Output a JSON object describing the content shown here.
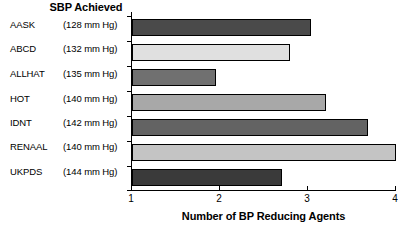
{
  "chart_data": {
    "type": "bar",
    "orientation": "horizontal",
    "title": "SBP Achieved",
    "xlabel": "Number of BP Reducing Agents",
    "ylabel": "",
    "xlim": [
      1,
      4
    ],
    "xticks": [
      "1",
      "2",
      "3",
      "4"
    ],
    "grid": false,
    "legend": null,
    "categories": [
      "AASK",
      "ABCD",
      "ALLHAT",
      "HOT",
      "IDNT",
      "RENAAL",
      "UKPDS"
    ],
    "values": [
      3.03,
      2.8,
      1.95,
      3.2,
      3.68,
      4.0,
      2.7
    ],
    "secondary_labels": [
      "(128 mm Hg)",
      "(132 mm Hg)",
      "(135 mm Hg)",
      "(140 mm Hg)",
      "(142 mm Hg)",
      "(140 mm Hg)",
      "(144 mm Hg)"
    ],
    "bar_colors": [
      "#4a4a4a",
      "#e0e0e0",
      "#707070",
      "#a8a8a8",
      "#636363",
      "#c4c4c4",
      "#3a3a3a"
    ],
    "rows": [
      {
        "study": "AASK",
        "sbp": "(128 mm Hg)",
        "value": 3.03,
        "color": "#4a4a4a"
      },
      {
        "study": "ABCD",
        "sbp": "(132 mm Hg)",
        "value": 2.8,
        "color": "#e0e0e0"
      },
      {
        "study": "ALLHAT",
        "sbp": "(135 mm Hg)",
        "value": 1.95,
        "color": "#707070"
      },
      {
        "study": "HOT",
        "sbp": "(140 mm Hg)",
        "value": 3.2,
        "color": "#a8a8a8"
      },
      {
        "study": "IDNT",
        "sbp": "(142 mm Hg)",
        "value": 3.68,
        "color": "#636363"
      },
      {
        "study": "RENAAL",
        "sbp": "(140 mm Hg)",
        "value": 4.0,
        "color": "#c4c4c4"
      },
      {
        "study": "UKPDS",
        "sbp": "(144 mm Hg)",
        "value": 2.7,
        "color": "#3a3a3a"
      }
    ]
  }
}
